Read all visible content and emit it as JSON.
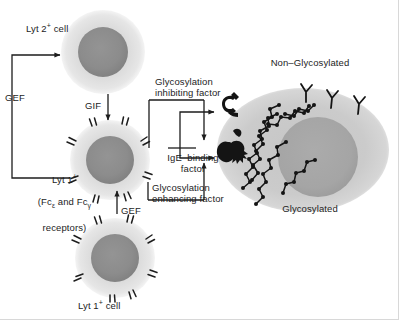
{
  "figure": {
    "background_color": "#ffffff"
  },
  "colors": {
    "cell_cytoplasm": "#dcdcdc",
    "cell_cytoplasm_edge": "#e8e8e8",
    "cell_nucleus": "#8c8c8c",
    "big_cell_cytoplasm": "#c9c9c9",
    "big_cell_nucleus": "#a8a8a8",
    "line": "#1d1d1d",
    "text": "#1d1d1d",
    "glyph": "#121212"
  },
  "labels": {
    "lyt2_cell": "Lyt 2",
    "lyt2_cell_sup": "+",
    "lyt2_cell_tail": " cell",
    "gef_left": "GEF",
    "gif": "GIF",
    "glycosylation_inhibiting_factor_line1": "Glycosylation",
    "glycosylation_inhibiting_factor_line2": "inhibiting factor",
    "lyt1_receptor_line1": "Lyt 1",
    "lyt1_receptor_line1_sup": "+",
    "lyt1_receptor_line2_a": "(Fc",
    "lyt1_receptor_line2_eps": "ε",
    "lyt1_receptor_line2_b": " and Fc",
    "lyt1_receptor_line2_gam": "γ",
    "lyt1_receptor_line3": "receptors)",
    "gef_lower": "GEF",
    "ige_binding_factor_line1": "IgE  binding",
    "ige_binding_factor_line2": "factor",
    "glycosylation_enhancing_factor_line1": "Glycosylation",
    "glycosylation_enhancing_factor_line2": "enhancing factor",
    "lyt1_cell": "Lyt 1",
    "lyt1_cell_sup": "+",
    "lyt1_cell_tail": " cell",
    "non_glycosylated": "Non–Glycosylated",
    "glycosylated": "Glycosylated"
  },
  "icons": {
    "ige_receptor_hook": "ige-binding-factor-hook-icon",
    "ige_receptor_blob": "ige-binding-factor-blob-icon",
    "antibody_y": "y-shaped-antibody-receptor-icon",
    "glyco_chain": "glycosylated-chain-icon",
    "surface_spike": "cell-surface-receptor-spike-icon"
  },
  "cells": [
    {
      "name": "lyt2-cell",
      "cx": 103,
      "cy": 52,
      "r": 42,
      "nucleus_r": 25
    },
    {
      "name": "lyt1-receptor-cell",
      "cx": 110,
      "cy": 160,
      "r": 40,
      "nucleus_r": 24,
      "spikes": true
    },
    {
      "name": "lyt1-cell",
      "cx": 115,
      "cy": 258,
      "r": 40,
      "nucleus_r": 24,
      "spikes": true
    },
    {
      "name": "target-mast-cell",
      "cx": 303,
      "cy": 150,
      "rx": 86,
      "ry": 62,
      "nucleus_r": 40
    }
  ]
}
